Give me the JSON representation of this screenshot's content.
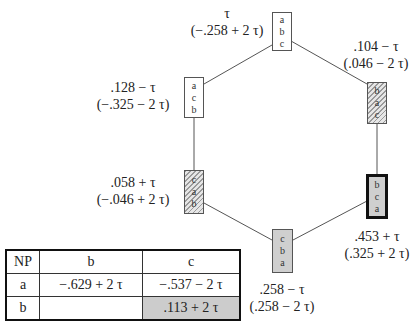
{
  "diagram": {
    "nodes": [
      {
        "id": "top",
        "order": [
          "a",
          "b",
          "c"
        ],
        "style": "white",
        "line1": "τ",
        "line2": "(−.258 + 2 τ)"
      },
      {
        "id": "top-right",
        "order": [
          "b",
          "a",
          "c"
        ],
        "style": "hatched",
        "line1": ".104 − τ",
        "line2": "(.046 − 2 τ)"
      },
      {
        "id": "top-left",
        "order": [
          "a",
          "c",
          "b"
        ],
        "style": "white",
        "line1": ".128 − τ",
        "line2": "(−.325 − 2 τ)"
      },
      {
        "id": "bottom-left",
        "order": [
          "c",
          "a",
          "b"
        ],
        "style": "hatched",
        "line1": ".058 + τ",
        "line2": "(−.046 + 2 τ)"
      },
      {
        "id": "bottom-right",
        "order": [
          "b",
          "c",
          "a"
        ],
        "style": "thick-gray",
        "line1": ".453 + τ",
        "line2": "(.325 + 2 τ)"
      },
      {
        "id": "bottom",
        "order": [
          "c",
          "b",
          "a"
        ],
        "style": "gray",
        "line1": ".258 − τ",
        "line2": "(.258 − 2 τ)"
      }
    ],
    "edges": [
      [
        "top",
        "top-right"
      ],
      [
        "top",
        "top-left"
      ],
      [
        "top-right",
        "bottom-right"
      ],
      [
        "top-left",
        "bottom-left"
      ],
      [
        "bottom-left",
        "bottom"
      ],
      [
        "bottom-right",
        "bottom"
      ]
    ]
  },
  "table": {
    "header": [
      "NP",
      "b",
      "c"
    ],
    "rows": [
      [
        "a",
        "−.629 + 2 τ",
        "−.537 − 2 τ"
      ],
      [
        "b",
        "",
        ".113 + 2 τ"
      ]
    ],
    "shaded_cell": "b-c"
  }
}
